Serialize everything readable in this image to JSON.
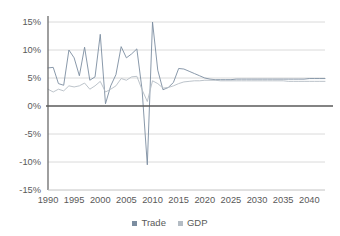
{
  "chart_data": {
    "type": "line",
    "title": "",
    "subtitle": "",
    "xlabel": "",
    "ylabel": "",
    "xlim": [
      1990,
      2043
    ],
    "ylim": [
      -15,
      15
    ],
    "grid": true,
    "y_tick_labels": [
      "15%",
      "10%",
      "5%",
      "0%",
      "-5%",
      "-10%",
      "-15%"
    ],
    "y_ticks": [
      15,
      10,
      5,
      0,
      -5,
      -10,
      -15
    ],
    "x_tick_labels": [
      "1990",
      "1995",
      "2000",
      "2005",
      "2010",
      "2015",
      "2020",
      "2025",
      "2030",
      "2035",
      "2040"
    ],
    "x_ticks": [
      1990,
      1995,
      2000,
      2005,
      2010,
      2015,
      2020,
      2025,
      2030,
      2035,
      2040
    ],
    "zero_line": 0,
    "legend_position": "bottom",
    "x": [
      1990,
      1991,
      1992,
      1993,
      1994,
      1995,
      1996,
      1997,
      1998,
      1999,
      2000,
      2001,
      2002,
      2003,
      2004,
      2005,
      2006,
      2007,
      2008,
      2009,
      2010,
      2011,
      2012,
      2013,
      2014,
      2015,
      2016,
      2017,
      2018,
      2019,
      2020,
      2021,
      2022,
      2023,
      2024,
      2025,
      2026,
      2027,
      2028,
      2029,
      2030,
      2031,
      2032,
      2033,
      2034,
      2035,
      2036,
      2037,
      2038,
      2039,
      2040,
      2041,
      2042,
      2043
    ],
    "series": [
      {
        "name": "Trade",
        "color": "#7c8da0",
        "values": [
          6.8,
          6.9,
          4.0,
          3.7,
          10.0,
          8.6,
          5.4,
          10.5,
          4.6,
          5.2,
          12.8,
          0.4,
          3.6,
          5.6,
          10.6,
          8.6,
          9.3,
          10.2,
          2.9,
          -10.5,
          15.0,
          6.4,
          2.9,
          3.3,
          4.2,
          6.7,
          6.6,
          6.2,
          5.8,
          5.4,
          5.0,
          4.8,
          4.7,
          4.7,
          4.7,
          4.7,
          4.8,
          4.8,
          4.8,
          4.8,
          4.8,
          4.8,
          4.8,
          4.8,
          4.8,
          4.8,
          4.8,
          4.8,
          4.8,
          4.8,
          4.9,
          4.9,
          4.9,
          4.9
        ]
      },
      {
        "name": "GDP",
        "color": "#b4bcc4",
        "values": [
          3.0,
          2.5,
          3.0,
          2.7,
          3.6,
          3.4,
          3.6,
          4.1,
          3.0,
          3.6,
          4.4,
          2.5,
          3.0,
          3.6,
          4.9,
          4.6,
          5.2,
          5.3,
          2.9,
          0.8,
          4.5,
          4.0,
          3.2,
          3.3,
          3.6,
          4.0,
          4.3,
          4.4,
          4.5,
          4.5,
          4.6,
          4.6,
          4.6,
          4.5,
          4.5,
          4.5,
          4.5,
          4.5,
          4.5,
          4.5,
          4.5,
          4.5,
          4.5,
          4.5,
          4.5,
          4.5,
          4.4,
          4.4,
          4.4,
          4.4,
          4.4,
          4.4,
          4.4,
          4.4
        ]
      }
    ]
  },
  "legend": {
    "items": [
      {
        "label": "Trade",
        "color": "#7c8da0"
      },
      {
        "label": "GDP",
        "color": "#b4bcc4"
      }
    ]
  },
  "colors": {
    "background": "#ffffff",
    "gridline": "#d0d0d0",
    "axis": "#6b6b6b",
    "zero_line": "#5a5a5a",
    "tick_text": "#595959"
  }
}
